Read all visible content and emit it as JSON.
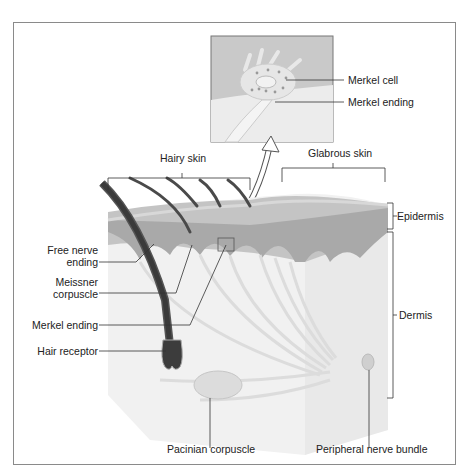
{
  "figure": {
    "type": "skin-mechanoreceptors-diagram",
    "inset": {
      "labels": [
        "Merkel cell",
        "Merkel ending"
      ]
    },
    "regions": {
      "hairy_skin": "Hairy skin",
      "glabrous_skin": "Glabrous skin"
    },
    "layers": {
      "epidermis": "Epidermis",
      "dermis": "Dermis"
    },
    "left_labels": {
      "free_nerve_1": "Free nerve",
      "free_nerve_2": "ending",
      "meissner_1": "Meissner",
      "meissner_2": "corpuscle",
      "merkel_ending": "Merkel ending",
      "hair_receptor": "Hair receptor"
    },
    "bottom_labels": {
      "pacinian": "Pacinian corpuscle",
      "nerve_bundle": "Peripheral nerve bundle"
    }
  }
}
